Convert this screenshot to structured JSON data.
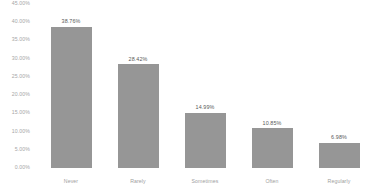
{
  "chart_data": {
    "type": "bar",
    "title": "",
    "subtitle": "",
    "xlabel": "",
    "ylabel": "",
    "categories": [
      "Never",
      "Rarely",
      "Sometimes",
      "Often",
      "Regularly"
    ],
    "values": [
      38.76,
      28.42,
      14.99,
      10.85,
      6.98
    ],
    "value_labels": [
      "38.76%",
      "28.42%",
      "14.99%",
      "10.85%",
      "6.98%"
    ],
    "ylim": [
      0,
      45
    ],
    "ytick_step": 5,
    "ytick_labels": [
      "45.00%",
      "40.00%",
      "35.00%",
      "30.00%",
      "25.00%",
      "20.00%",
      "15.00%",
      "10.00%",
      "5.00%",
      "0.00%"
    ],
    "ytick_values": [
      45,
      40,
      35,
      30,
      25,
      20,
      15,
      10,
      5,
      0
    ],
    "grid": false,
    "legend": "none",
    "bar_color": "#969696",
    "background_color": "#ffffff",
    "axis_text_color": "#a6a6a6",
    "value_text_color": "#595959"
  }
}
